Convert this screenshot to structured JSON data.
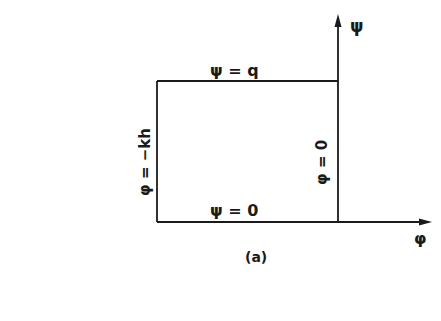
{
  "figure": {
    "caption": "(a)",
    "axes": {
      "vertical_label": "ψ",
      "horizontal_label": "φ"
    },
    "boundaries": {
      "top": "ψ = q",
      "bottom": "ψ = 0",
      "left": "φ = −kh",
      "right": "φ = 0"
    },
    "colors": {
      "ink": "#1a1a1a",
      "background": "#ffffff"
    }
  }
}
